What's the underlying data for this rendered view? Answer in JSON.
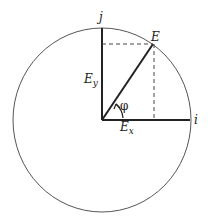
{
  "diagram": {
    "type": "vector-decomposition",
    "labels": {
      "j_axis": "j",
      "i_axis": "i",
      "vector": "E",
      "y_component_base": "E",
      "y_component_sub": "y",
      "x_component_base": "E",
      "x_component_sub": "x",
      "angle": "φ"
    },
    "colors": {
      "stroke": "#222222",
      "circle": "#555555",
      "dashed": "#444444",
      "background": "#ffffff"
    }
  }
}
